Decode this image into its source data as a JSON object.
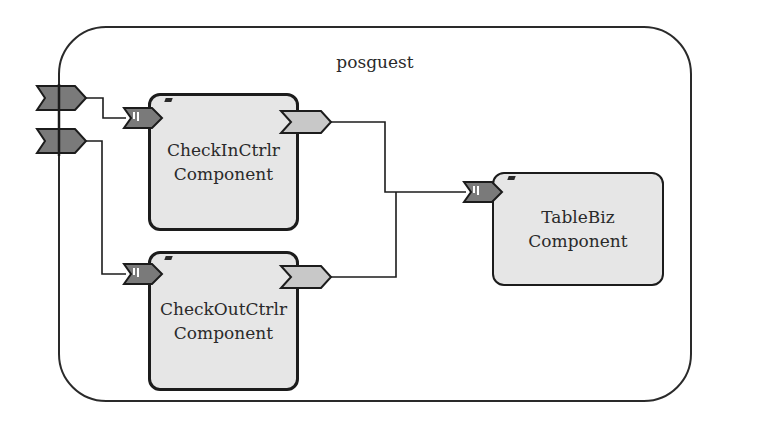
{
  "composite": {
    "name": "posguest"
  },
  "components": [
    {
      "id": "checkin",
      "line1": "CheckInCtrlr",
      "line2": "Component"
    },
    {
      "id": "checkout",
      "line1": "CheckOutCtrlr",
      "line2": "Component"
    },
    {
      "id": "tablebiz",
      "line1": "TableBiz",
      "line2": "Component"
    }
  ],
  "ports": {
    "composite_services": 2,
    "component_services": [
      "checkin",
      "checkout",
      "tablebiz"
    ],
    "component_references": [
      "checkin",
      "checkout"
    ]
  },
  "wires": [
    {
      "from": "composite-service-1",
      "to": "checkin-service"
    },
    {
      "from": "composite-service-2",
      "to": "checkout-service"
    },
    {
      "from": "checkin-reference",
      "to": "tablebiz-service"
    },
    {
      "from": "checkout-reference",
      "to": "tablebiz-service"
    }
  ],
  "colors": {
    "service_port": "#7a7a7a",
    "reference_port": "#c8c8c8",
    "component_fill": "#e6e6e6",
    "stroke": "#1c1c1c"
  }
}
